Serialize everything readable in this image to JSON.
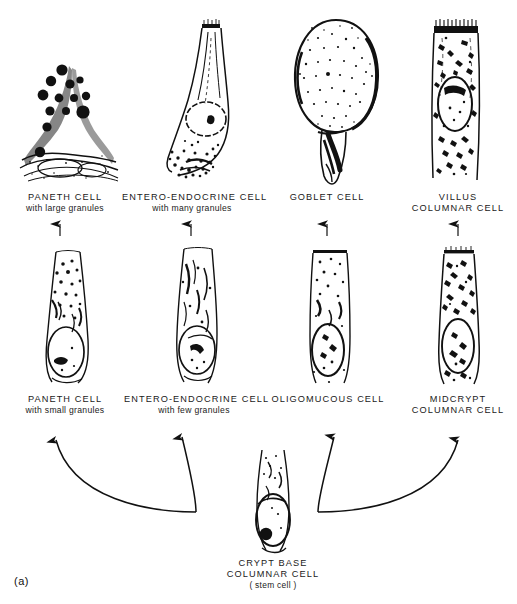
{
  "figure": {
    "panel_letter": "(a)",
    "title_implied": "Intestinal epithelial cell lineages"
  },
  "rows": {
    "top": {
      "cells": [
        {
          "id": "paneth-large",
          "label_line1": "PANETH  CELL",
          "label_line2": "with large granules",
          "icon": "paneth-cell-large-granules-icon"
        },
        {
          "id": "entero-endocrine-many",
          "label_line1": "ENTERO-ENDOCRINE CELL",
          "label_line2": "with many granules",
          "icon": "entero-endocrine-cell-many-granules-icon"
        },
        {
          "id": "goblet",
          "label_line1": "GOBLET CELL",
          "label_line2": "",
          "icon": "goblet-cell-icon"
        },
        {
          "id": "villus-columnar",
          "label_line1": "VILLUS",
          "label_line2": "COLUMNAR CELL",
          "icon": "villus-columnar-cell-icon"
        }
      ]
    },
    "middle": {
      "cells": [
        {
          "id": "paneth-small",
          "label_line1": "PANETH  CELL",
          "label_line2": "with small granules",
          "icon": "paneth-cell-small-granules-icon"
        },
        {
          "id": "entero-endocrine-few",
          "label_line1": "ENTERO-ENDOCRINE CELL",
          "label_line2": "with few granules",
          "icon": "entero-endocrine-cell-few-granules-icon"
        },
        {
          "id": "oligomucous",
          "label_line1": "OLIGOMUCOUS  CELL",
          "label_line2": "",
          "icon": "oligomucous-cell-icon"
        },
        {
          "id": "midcrypt-columnar",
          "label_line1": "MIDCRYPT",
          "label_line2": "COLUMNAR CELL",
          "icon": "midcrypt-columnar-cell-icon"
        }
      ]
    },
    "bottom": {
      "cells": [
        {
          "id": "crypt-base-columnar",
          "label_line1": "CRYPT  BASE",
          "label_line2": "COLUMNAR  CELL",
          "label_line3": "( stem cell )",
          "icon": "crypt-base-columnar-stem-cell-icon"
        }
      ]
    }
  },
  "arrows": {
    "straight_up": [
      {
        "name": "arrow-paneth-small-to-large",
        "x": 60
      },
      {
        "name": "arrow-entero-few-to-many",
        "x": 191
      },
      {
        "name": "arrow-oligomucous-to-goblet",
        "x": 327
      },
      {
        "name": "arrow-midcrypt-to-villus",
        "x": 458
      }
    ],
    "curved_from_stem": [
      {
        "name": "arrow-stem-to-paneth-small"
      },
      {
        "name": "arrow-stem-to-entero-few"
      },
      {
        "name": "arrow-stem-to-oligomucous"
      },
      {
        "name": "arrow-stem-to-midcrypt"
      }
    ]
  },
  "colors": {
    "ink": "#111111",
    "background": "#ffffff"
  }
}
